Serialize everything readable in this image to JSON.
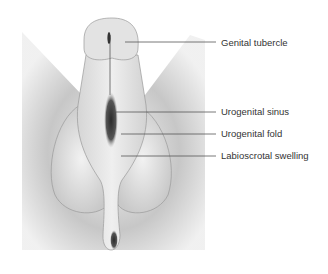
{
  "diagram": {
    "labels": [
      {
        "id": "genital-tubercle",
        "text": "Genital tubercle",
        "x": 221,
        "y": 37,
        "line": [
          125,
          42,
          216,
          42
        ]
      },
      {
        "id": "urogenital-sinus",
        "text": "Urogenital sinus",
        "x": 221,
        "y": 106,
        "line": [
          116,
          112,
          216,
          112
        ]
      },
      {
        "id": "urogenital-fold",
        "text": "Urogenital fold",
        "x": 221,
        "y": 128,
        "line": [
          121,
          134,
          216,
          134
        ]
      },
      {
        "id": "labioscrotal-swelling",
        "text": "Labioscrotal swelling",
        "x": 221,
        "y": 150,
        "line": [
          121,
          156,
          216,
          156
        ]
      }
    ]
  }
}
